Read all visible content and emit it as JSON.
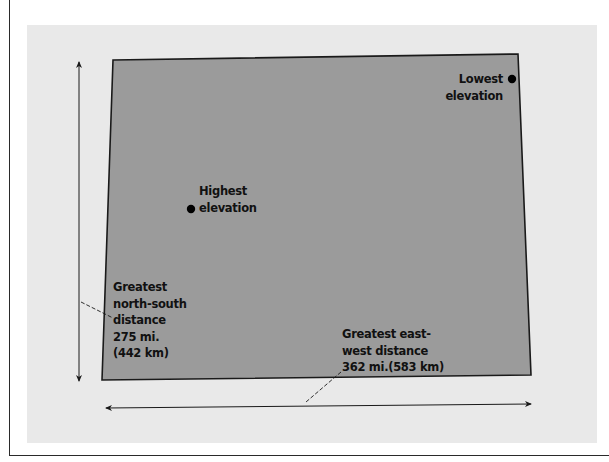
{
  "colors": {
    "page_background": "#ffffff",
    "panel_background": "#e9e9e9",
    "shape_fill": "#9b9b9b",
    "outline": "#1a1a1a",
    "marker": "#000000"
  },
  "shape": {
    "name": "state-outline",
    "corners": {
      "top_left": [
        113,
        60
      ],
      "top_right": [
        518,
        54
      ],
      "bottom_right": [
        531,
        375
      ],
      "bottom_left": [
        102,
        380
      ]
    }
  },
  "markers": {
    "lowest": {
      "label_lines": [
        "Lowest",
        "elevation"
      ],
      "point": [
        512,
        79
      ]
    },
    "highest": {
      "label_lines": [
        "Highest",
        "elevation"
      ],
      "point": [
        191,
        209
      ]
    }
  },
  "measurements": {
    "north_south": {
      "label_lines": [
        "Greatest",
        "north-south",
        "distance",
        "275 mi.",
        "(442 km)"
      ],
      "miles": "275 mi.",
      "kilometers": "(442 km)",
      "arrow": {
        "x": 79,
        "y_top": 60,
        "y_bottom": 382
      }
    },
    "east_west": {
      "label_lines": [
        "Greatest east-",
        "west distance",
        "362 mi.(583 km)"
      ],
      "miles": "362 mi.",
      "kilometers": "(583 km)",
      "arrow": {
        "x_left": 104,
        "y_left": 408,
        "x_right": 533,
        "y_right": 404
      }
    }
  }
}
